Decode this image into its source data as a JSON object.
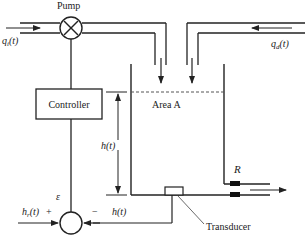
{
  "diagram": {
    "type": "liquid-level control system",
    "colors": {
      "line": "#222222",
      "background": "#ffffff",
      "dashed_level": "#555555"
    },
    "labels": {
      "pump": "Pump",
      "controller": "Controller",
      "area": "Area A",
      "inflow_q": "q",
      "inflow_sub": "i",
      "inflow_t": "(t)",
      "disturbance_q": "q",
      "disturbance_sub": "d",
      "disturbance_t": "(t)",
      "level_left": "h(t)",
      "resistance": "R",
      "error": "ε",
      "reference_h": "h",
      "reference_sub": "r",
      "reference_t": "(t)",
      "plus": "+",
      "minus": "−",
      "feedback_h": "h(t)",
      "transducer": "Transducer"
    },
    "icons": {
      "pump": "circle-x-icon",
      "summing_junction": "circle-icon",
      "valve": "resistance-valve-icon"
    }
  }
}
